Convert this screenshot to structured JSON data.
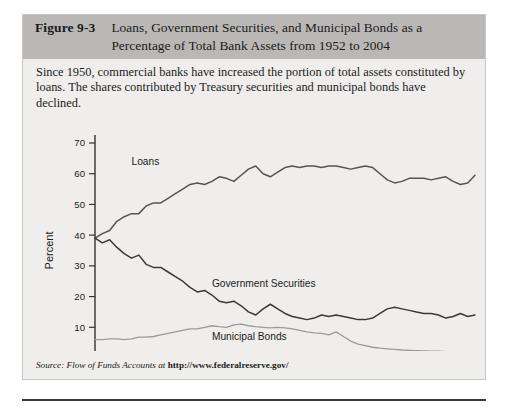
{
  "figure": {
    "number": "Figure 9-3",
    "title": "Loans, Government Securities, and Municipal Bonds as a Percentage of Total Bank Assets from 1952 to 2004",
    "caption": "Since 1950, commercial banks have increased the portion of total assets constituted by loans. The shares contributed by Treasury securities and municipal bonds have declined.",
    "source_lead": "Source: Flow of Funds Accounts at ",
    "source_url": "http://www.federalreserve.gov/"
  },
  "chart_data": {
    "type": "line",
    "title": "Loans, Government Securities, and Municipal Bonds as a Percentage of Total Bank Assets from 1952 to 2004",
    "xlabel": "",
    "ylabel": "Percent",
    "xlim": [
      1952,
      2004
    ],
    "ylim": [
      0,
      70
    ],
    "ytick_step": 10,
    "xtick_step": 4,
    "grid": false,
    "legend": "inline-labels",
    "yticks": [
      "0",
      "10",
      "20",
      "30",
      "40",
      "50",
      "60",
      "70"
    ],
    "xticks": [
      "1952",
      "1956",
      "1960",
      "1964",
      "1968",
      "1972",
      "1976",
      "1980",
      "1984",
      "1988",
      "1992",
      "1996",
      "2000",
      "2004"
    ],
    "x": [
      1952,
      1953,
      1954,
      1955,
      1956,
      1957,
      1958,
      1959,
      1960,
      1961,
      1962,
      1963,
      1964,
      1965,
      1966,
      1967,
      1968,
      1969,
      1970,
      1971,
      1972,
      1973,
      1974,
      1975,
      1976,
      1977,
      1978,
      1979,
      1980,
      1981,
      1982,
      1983,
      1984,
      1985,
      1986,
      1987,
      1988,
      1989,
      1990,
      1991,
      1992,
      1993,
      1994,
      1995,
      1996,
      1997,
      1998,
      1999,
      2000,
      2001,
      2002,
      2003,
      2004
    ],
    "series": [
      {
        "name": "Loans",
        "color": "#555555",
        "label_x": 1957,
        "label_y": 63,
        "values": [
          39.0,
          40.5,
          41.5,
          44.5,
          46.0,
          47.0,
          47.0,
          49.5,
          50.5,
          50.5,
          52.0,
          53.5,
          55.0,
          56.5,
          57.0,
          56.5,
          57.5,
          59.0,
          58.5,
          57.5,
          59.5,
          61.5,
          62.5,
          60.0,
          59.0,
          60.5,
          62.0,
          62.5,
          62.0,
          62.5,
          62.5,
          62.0,
          62.5,
          62.5,
          62.0,
          61.5,
          62.0,
          62.5,
          62.0,
          60.0,
          58.0,
          57.0,
          57.5,
          58.5,
          58.5,
          58.5,
          58.0,
          58.5,
          59.0,
          57.5,
          56.5,
          57.0,
          59.5
        ]
      },
      {
        "name": "Government Securities",
        "color": "#3a3a3a",
        "label_x": 1968,
        "label_y": 23,
        "values": [
          39.0,
          37.5,
          38.5,
          36.0,
          34.0,
          32.5,
          33.5,
          30.5,
          29.5,
          29.5,
          28.0,
          26.5,
          25.0,
          23.0,
          21.5,
          22.0,
          20.5,
          18.5,
          18.0,
          18.5,
          17.0,
          15.0,
          14.0,
          16.0,
          17.5,
          16.0,
          14.5,
          13.5,
          13.0,
          12.5,
          13.0,
          14.0,
          13.5,
          14.0,
          13.5,
          13.0,
          12.5,
          12.5,
          13.0,
          14.5,
          16.0,
          16.5,
          16.0,
          15.5,
          15.0,
          14.5,
          14.5,
          14.0,
          13.0,
          13.5,
          14.5,
          13.5,
          14.0
        ]
      },
      {
        "name": "Municipal Bonds",
        "color": "#9a9a9a",
        "label_x": 1968,
        "label_y": 6,
        "values": [
          6.0,
          6.0,
          6.2,
          6.2,
          6.0,
          6.2,
          6.8,
          6.8,
          7.0,
          7.5,
          8.0,
          8.5,
          9.0,
          9.5,
          9.5,
          10.0,
          10.5,
          10.2,
          10.0,
          10.8,
          11.0,
          10.5,
          10.2,
          10.0,
          9.8,
          10.0,
          9.8,
          9.5,
          9.0,
          8.5,
          8.2,
          8.0,
          7.5,
          8.5,
          7.0,
          5.5,
          4.5,
          4.0,
          3.5,
          3.2,
          3.0,
          2.8,
          2.6,
          2.5,
          2.4,
          2.3,
          2.2,
          2.2,
          2.1,
          2.1,
          2.0,
          2.0,
          2.0
        ]
      }
    ]
  }
}
